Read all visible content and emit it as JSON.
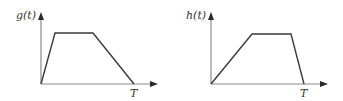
{
  "figures": [
    {
      "id": "g",
      "ylabel": "g(t)",
      "xlabel": "T",
      "shape": "trapezoid",
      "description": "fast rise, flat top, slow fall to zero at T",
      "points": [
        [
          0,
          0
        ],
        [
          0.15,
          1
        ],
        [
          0.55,
          1
        ],
        [
          1.0,
          0
        ]
      ]
    },
    {
      "id": "h",
      "ylabel": "h(t)",
      "xlabel": "T",
      "shape": "trapezoid",
      "description": "slow rise, flat top, fast fall to zero at T",
      "points": [
        [
          0,
          0
        ],
        [
          0.44,
          1
        ],
        [
          0.86,
          1
        ],
        [
          1.0,
          0
        ]
      ]
    }
  ]
}
